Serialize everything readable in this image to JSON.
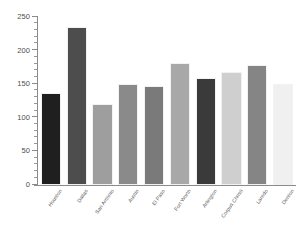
{
  "chart_data": {
    "type": "bar",
    "title": "",
    "subtitle": "",
    "xlabel": "",
    "ylabel": "",
    "ylim": [
      0,
      250
    ],
    "y_ticks": [
      0,
      50,
      100,
      150,
      200,
      250
    ],
    "y_minor_tick_step": 10,
    "grid": false,
    "legend": false,
    "legend_position": "none",
    "categories": [
      "Houston",
      "Dallas",
      "San Antonio",
      "Austin",
      "El Paso",
      "Fort Worth",
      "Arlington",
      "Corpus Christi",
      "Laredo",
      "Denton"
    ],
    "values": [
      137,
      235,
      120,
      151,
      148,
      181,
      159,
      168,
      179,
      151
    ],
    "bar_colors": [
      "#1f1f1f",
      "#4d4d4d",
      "#9e9e9e",
      "#8a8a8a",
      "#7a7a7a",
      "#a8a8a8",
      "#3a3a3a",
      "#cfcfcf",
      "#858585",
      "#f0f0f0"
    ]
  },
  "axis": {
    "y_tick_labels": [
      "0",
      "50",
      "100",
      "150",
      "200",
      "250"
    ]
  }
}
